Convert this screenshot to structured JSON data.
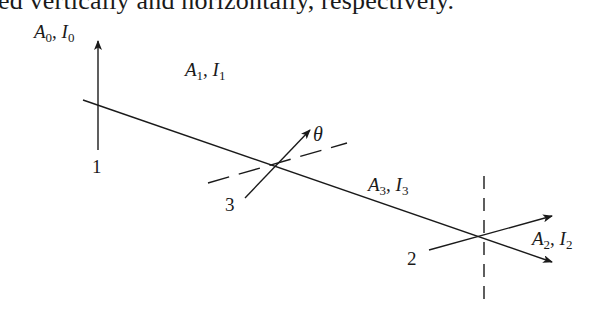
{
  "caption_fragment": "ed vertically and horizontally, respectively.",
  "labels": {
    "beam0": {
      "amp": "A",
      "amp_sub": "0",
      "sep": ", ",
      "int": "I",
      "int_sub": "0"
    },
    "beam1": {
      "amp": "A",
      "amp_sub": "1",
      "sep": ", ",
      "int": "I",
      "int_sub": "1"
    },
    "beam3": {
      "amp": "A",
      "amp_sub": "3",
      "sep": ", ",
      "int": "I",
      "int_sub": "3"
    },
    "beam2": {
      "amp": "A",
      "amp_sub": "2",
      "sep": ", ",
      "int": "I",
      "int_sub": "2"
    }
  },
  "polarizers": [
    {
      "id": "1",
      "label": "1",
      "orientation": "vertical"
    },
    {
      "id": "3",
      "label": "3",
      "orientation": "angle theta"
    },
    {
      "id": "2",
      "label": "2",
      "orientation": "horizontal"
    }
  ],
  "angle_symbol": "θ",
  "colors": {
    "ink": "#1a1a1a",
    "background": "#ffffff"
  }
}
